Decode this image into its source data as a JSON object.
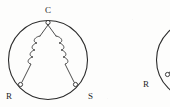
{
  "figure": {
    "background_color": "#fdfdfc",
    "ink_color": "#2b2b2b",
    "width": 170,
    "height": 107
  },
  "diagrams": [
    {
      "id": "left-diagram",
      "name": "complete-winding-diagram",
      "clipped": false,
      "stator": {
        "shape": "circle",
        "center_x": 48,
        "center_y": 60,
        "radius": 40
      },
      "terminals": [
        {
          "key": "C",
          "label": "C",
          "role": "common-terminal",
          "node_x": 48,
          "node_y": 22,
          "label_x": 48,
          "label_y": 12
        },
        {
          "key": "R",
          "label": "R",
          "role": "run-terminal",
          "node_x": 20,
          "node_y": 85,
          "label_x": 8,
          "label_y": 97
        },
        {
          "key": "S",
          "label": "S",
          "role": "start-terminal",
          "node_x": 76,
          "node_y": 85,
          "label_x": 89,
          "label_y": 97
        }
      ],
      "windings": [
        {
          "key": "C-R",
          "name": "run-winding-coil",
          "from": "C",
          "to": "R",
          "loops": 4
        },
        {
          "key": "C-S",
          "name": "start-winding-coil",
          "from": "C",
          "to": "S",
          "loops": 4
        }
      ]
    },
    {
      "id": "right-diagram",
      "name": "partial-winding-diagram",
      "clipped": true,
      "stator": {
        "shape": "circle",
        "center_x": 196,
        "center_y": 60,
        "radius": 40
      },
      "terminals": [
        {
          "key": "R",
          "label": "R",
          "role": "run-terminal",
          "node_x": 168,
          "node_y": 74,
          "label_x": 147,
          "label_y": 85
        }
      ],
      "windings": [
        {
          "key": "R-lead",
          "name": "run-winding-lead",
          "from": "R",
          "to": "off-screen",
          "loops": 0
        }
      ]
    }
  ],
  "labels": {
    "common": "C",
    "run": "R",
    "start": "S"
  }
}
